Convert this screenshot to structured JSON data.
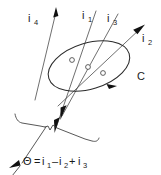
{
  "figure": {
    "background_color": "#ffffff",
    "ink_color": "#2b2b2b",
    "width": 161,
    "height": 175
  },
  "labels": {
    "current_4": {
      "base": "i",
      "sub": "4"
    },
    "current_1": {
      "base": "i",
      "sub": "1"
    },
    "current_3": {
      "base": "i",
      "sub": "3"
    },
    "current_2": {
      "base": "i",
      "sub": "2"
    },
    "contour": "C"
  },
  "equation": {
    "lhs": "Θ",
    "equals": "=",
    "term1_base": "i",
    "term1_sub": "1",
    "op1": "–",
    "term2_base": "i",
    "term2_sub": "2",
    "op2": "+",
    "term3_base": "i",
    "term3_sub": "3",
    "plain": "Θ = i1 – i2 + i3"
  },
  "elements": {
    "contour_name": "closed-contour-C",
    "surface_name": "torn-surface",
    "wires": [
      {
        "name": "wire-i4",
        "direction": "up",
        "pierces_surface": false
      },
      {
        "name": "wire-i1",
        "direction": "down",
        "pierces_surface": true
      },
      {
        "name": "wire-i3",
        "direction": "down",
        "pierces_surface": true
      },
      {
        "name": "wire-i2",
        "direction": "up-right",
        "pierces_surface": true
      }
    ],
    "pierce_points": 3,
    "circulation_direction": "clockwise"
  }
}
